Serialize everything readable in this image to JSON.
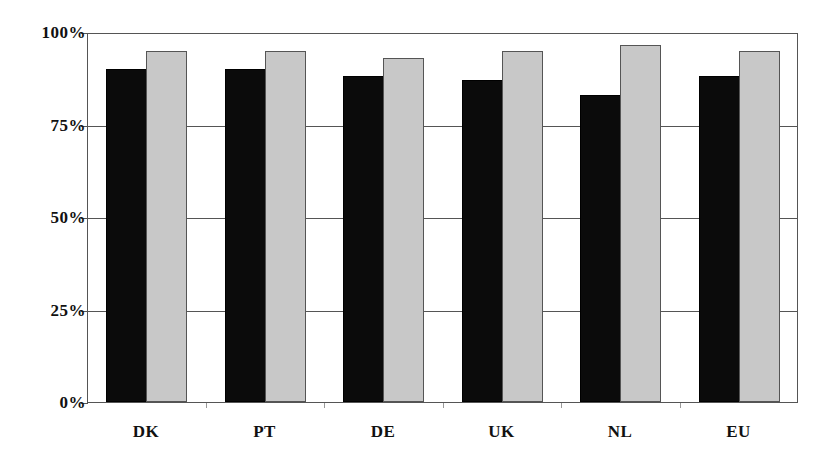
{
  "chart_data": {
    "type": "bar",
    "title": "",
    "xlabel": "",
    "ylabel": "",
    "categories": [
      "DK",
      "PT",
      "DE",
      "UK",
      "NL",
      "EU"
    ],
    "series": [
      {
        "name": "Series 1 (black)",
        "color": "#0b0b0b",
        "values": [
          90,
          90,
          88,
          87,
          83,
          88
        ]
      },
      {
        "name": "Series 2 (gray)",
        "color": "#c8c8c8",
        "values": [
          95,
          95,
          93,
          95,
          96.5,
          95
        ]
      }
    ],
    "ylim": [
      0,
      100
    ],
    "yticks": [
      0,
      25,
      50,
      75,
      100
    ],
    "ytick_labels": [
      "0%",
      "25%",
      "50%",
      "75%",
      "100%"
    ],
    "grid": true,
    "legend": "none"
  },
  "axis": {
    "y_labels": [
      "0%",
      "25%",
      "50%",
      "75%",
      "100%"
    ],
    "x_labels": [
      "DK",
      "PT",
      "DE",
      "UK",
      "NL",
      "EU"
    ]
  }
}
